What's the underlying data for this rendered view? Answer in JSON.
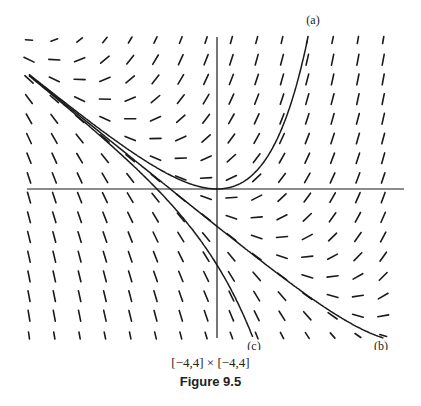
{
  "chart_data": {
    "type": "slope-field",
    "equation": "y' = x + y",
    "xlim": [
      -4,
      4
    ],
    "ylim": [
      -4,
      4
    ],
    "window_label": "[−4,4] × [−4,4]",
    "caption": "Figure 9.5",
    "field": {
      "columns": 15,
      "rows": 16
    },
    "curves": [
      {
        "label": "(a)",
        "formula": "y = e^x − x − 1",
        "C": 1
      },
      {
        "label": "(b)",
        "formula": "y = C·e^x − x − 1",
        "C": 0.018
      },
      {
        "label": "(c)",
        "formula": "y = −e^x − x − 1",
        "C": -1
      }
    ]
  },
  "colors": {
    "ink": "#1a1a1a",
    "background": "#ffffff"
  }
}
